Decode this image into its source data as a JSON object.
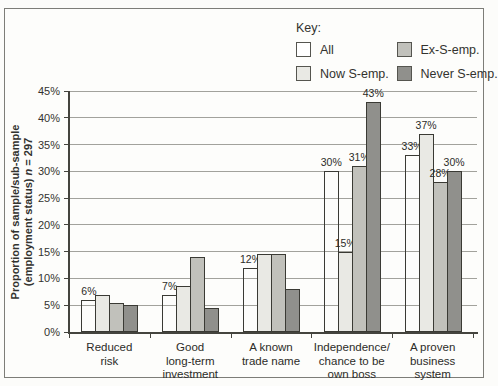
{
  "figure": {
    "legend": {
      "title": "Key:",
      "items": [
        {
          "label": "All",
          "color": "#ffffff"
        },
        {
          "label": "Now S-emp.",
          "color": "#e9e9e4"
        },
        {
          "label": "Ex-S-emp.",
          "color": "#c1c1bb"
        },
        {
          "label": "Never S-emp.",
          "color": "#90908c"
        }
      ]
    },
    "y_axis": {
      "title_line1": "Proportion of sample/sub-sample",
      "title_line2_prefix": "(employment status) ",
      "title_line2_n": "n",
      "title_line2_suffix": " = 297",
      "tick_suffix": "%"
    }
  },
  "chart_data": {
    "type": "bar",
    "title": "",
    "ylabel": "Proportion of sample/sub-sample (employment status) n = 297",
    "ylim": [
      0,
      45
    ],
    "ytick_step": 5,
    "grid": true,
    "legend_position": "top-right",
    "categories": [
      "Reduced risk",
      "Good long-term investment",
      "A known trade name",
      "Independence/chance to be own boss",
      "A proven business system"
    ],
    "category_lines": [
      [
        "Reduced",
        "risk"
      ],
      [
        "Good",
        "long-term",
        "investment"
      ],
      [
        "A known",
        "trade name"
      ],
      [
        "Independence/",
        "chance to be",
        "own boss"
      ],
      [
        "A proven",
        "business",
        "system"
      ]
    ],
    "series": [
      {
        "name": "All",
        "color": "#ffffff",
        "values": [
          6,
          7,
          12,
          30,
          33
        ],
        "labels": [
          "6%",
          "7%",
          "12%",
          "30%",
          "33%"
        ]
      },
      {
        "name": "Now S-emp.",
        "color": "#e9e9e4",
        "values": [
          7,
          8.5,
          14.5,
          15,
          37
        ],
        "labels": [
          null,
          null,
          null,
          "15%",
          "37%"
        ]
      },
      {
        "name": "Ex-S-emp.",
        "color": "#c1c1bb",
        "values": [
          5.5,
          14,
          14.5,
          31,
          28
        ],
        "labels": [
          null,
          null,
          null,
          "31%",
          "28%"
        ]
      },
      {
        "name": "Never S-emp.",
        "color": "#90908c",
        "values": [
          5,
          4.5,
          8,
          43,
          30
        ],
        "labels": [
          null,
          null,
          null,
          "43%",
          "30%"
        ]
      }
    ]
  }
}
